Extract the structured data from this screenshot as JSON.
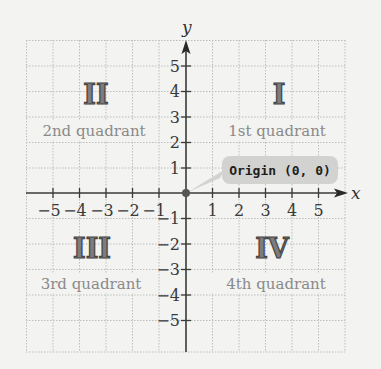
{
  "diagram": {
    "type": "coordinate-plane",
    "axes": {
      "x_label": "x",
      "y_label": "y",
      "x_ticks": [
        "-5",
        "-4",
        "-3",
        "-2",
        "-1",
        "1",
        "2",
        "3",
        "4",
        "5"
      ],
      "y_ticks": [
        "5",
        "4",
        "3",
        "2",
        "1",
        "-1",
        "-2",
        "-3",
        "-4",
        "-5"
      ]
    },
    "x_tick_labels": {
      "neg5": "−5",
      "neg4": "−4",
      "neg3": "−3",
      "neg2": "−2",
      "neg1": "−1",
      "pos1": "1",
      "pos2": "2",
      "pos3": "3",
      "pos4": "4",
      "pos5": "5"
    },
    "y_tick_labels": {
      "pos5": "5",
      "pos4": "4",
      "pos3": "3",
      "pos2": "2",
      "pos1": "1",
      "neg1": "−1",
      "neg2": "−2",
      "neg3": "−3",
      "neg4": "−4",
      "neg5": "−5"
    },
    "quadrants": {
      "q1": {
        "numeral": "I",
        "label": "1st quadrant"
      },
      "q2": {
        "numeral": "II",
        "label": "2nd quadrant"
      },
      "q3": {
        "numeral": "III",
        "label": "3rd quadrant"
      },
      "q4": {
        "numeral": "IV",
        "label": "4th quadrant"
      }
    },
    "origin": {
      "label": "Origin (0, 0)"
    },
    "colors": {
      "background": "#f3f3f1",
      "grid": "#bdbdbd",
      "axis": "#3a3a3a",
      "numeral_fill": "#7d7d7d",
      "quadrant_text": "#8a8a8a",
      "callout_bg": "#d2d2d0",
      "origin_dot": "#555555"
    }
  }
}
